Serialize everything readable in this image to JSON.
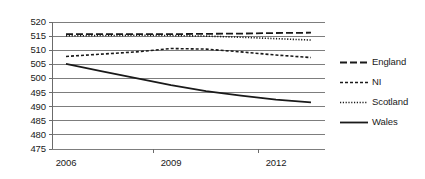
{
  "chart_data": {
    "type": "line",
    "title": "",
    "xlabel": "",
    "ylabel": "",
    "x": [
      2006,
      2007,
      2008,
      2009,
      2010,
      2011,
      2012,
      2013
    ],
    "xlim": [
      2005.6,
      2013.4
    ],
    "ylim": [
      475,
      520
    ],
    "xticks": [
      2006,
      2009,
      2012
    ],
    "xtick_labels": [
      "2006",
      "2009",
      "2012"
    ],
    "yticks": [
      475,
      480,
      485,
      490,
      495,
      500,
      505,
      510,
      515,
      520
    ],
    "ytick_labels": [
      "475",
      "480",
      "485",
      "490",
      "495",
      "500",
      "505",
      "510",
      "515",
      "520"
    ],
    "grid": true,
    "grid_axis": "y",
    "legend_position": "right",
    "series": [
      {
        "name": "England",
        "style": "dashed",
        "dash": "7,3",
        "color": "#1a1a1a",
        "width": 1.8,
        "values": [
          515.7,
          515.7,
          515.7,
          515.7,
          515.8,
          515.9,
          516.1,
          516.2
        ]
      },
      {
        "name": "NI",
        "style": "short-dashed",
        "dash": "3,2",
        "color": "#1a1a1a",
        "width": 1.6,
        "values": [
          507.8,
          508.6,
          509.4,
          510.6,
          510.4,
          509.4,
          508.3,
          507.4
        ]
      },
      {
        "name": "Scotland",
        "style": "dotted",
        "dash": "1.2,1.6",
        "color": "#1a1a1a",
        "width": 1.6,
        "values": [
          515.1,
          515.2,
          515.3,
          515.2,
          515.0,
          514.6,
          514.1,
          513.6
        ]
      },
      {
        "name": "Wales",
        "style": "solid",
        "dash": "",
        "color": "#1a1a1a",
        "width": 1.8,
        "values": [
          505.2,
          502.6,
          500.1,
          497.6,
          495.5,
          493.9,
          492.5,
          491.5
        ]
      }
    ]
  },
  "legend": {
    "items": [
      {
        "label": "England"
      },
      {
        "label": "NI"
      },
      {
        "label": "Scotland"
      },
      {
        "label": "Wales"
      }
    ]
  },
  "colors": {
    "axis": "#6b6b6b",
    "grid": "#7d7d7d",
    "text": "#1a1a1a",
    "series": "#1a1a1a",
    "background": "#ffffff"
  }
}
